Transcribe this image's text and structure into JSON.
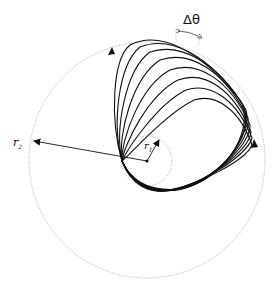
{
  "diagram": {
    "labels": {
      "delta_theta": "Δθ",
      "r2": "r",
      "r2_sub": "2",
      "r1": "r",
      "r1_sub": "1"
    },
    "colors": {
      "curve": "#111111",
      "dotted_circle": "#9a9a9a",
      "background": "#ffffff"
    },
    "outer_circle": {
      "cx": 147,
      "cy": 160,
      "r": 118
    },
    "inner_circle": {
      "cx": 147,
      "cy": 161,
      "r": 25
    },
    "petal_count": 8
  }
}
